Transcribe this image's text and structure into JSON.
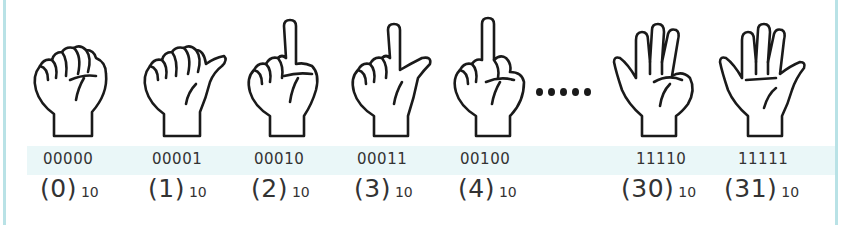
{
  "items": [
    {
      "binary": "00000",
      "decimal": "(0)",
      "base": "10",
      "gesture": "fist"
    },
    {
      "binary": "00001",
      "decimal": "(1)",
      "base": "10",
      "gesture": "thumb-out"
    },
    {
      "binary": "00010",
      "decimal": "(2)",
      "base": "10",
      "gesture": "index-up"
    },
    {
      "binary": "00011",
      "decimal": "(3)",
      "base": "10",
      "gesture": "index-and-thumb"
    },
    {
      "binary": "00100",
      "decimal": "(4)",
      "base": "10",
      "gesture": "middle-up"
    },
    {
      "binary": "11110",
      "decimal": "(30)",
      "base": "10",
      "gesture": "four-fingers"
    },
    {
      "binary": "11111",
      "decimal": "(31)",
      "base": "10",
      "gesture": "open-palm"
    }
  ],
  "ellipsis": "......",
  "colors": {
    "frame": "#b9e2e6",
    "band": "#eaf7f8",
    "ink": "#1a1a1a",
    "text": "#333333"
  }
}
